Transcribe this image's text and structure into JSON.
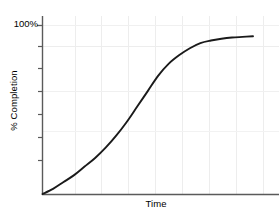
{
  "chart_data": {
    "type": "line",
    "title": "",
    "subtitle": "",
    "xlabel": "Time",
    "ylabel": "% Completion",
    "ytick_labels": [
      "100%"
    ],
    "xtick_labels": [],
    "grid": true,
    "legend": null,
    "xlim": [
      0,
      100
    ],
    "ylim": [
      0,
      100
    ],
    "annotations": [],
    "series": [
      {
        "name": "completion",
        "color": "#1a1a1a",
        "x": [
          0,
          5,
          10,
          15,
          20,
          25,
          30,
          35,
          40,
          45,
          50,
          55,
          60,
          65,
          70,
          75,
          80,
          85,
          90,
          95,
          100
        ],
        "y": [
          0,
          3,
          7,
          11,
          16,
          21,
          27,
          34,
          42,
          51,
          60,
          69,
          76,
          81,
          85,
          88,
          89.5,
          90.5,
          91.2,
          91.6,
          92
        ]
      }
    ]
  },
  "axes": {
    "y_axis_top_value": "100%",
    "x_axis_label": "Time",
    "y_axis_label": "% Completion"
  },
  "style": {
    "curve_color": "#1a1a1a",
    "axis_color": "#555555",
    "grid_color": "#eaeaea",
    "background": "#ffffff",
    "text_color": "#000000"
  }
}
